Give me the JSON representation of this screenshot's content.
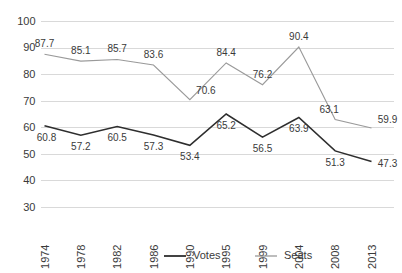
{
  "chart_data": {
    "type": "line",
    "title": "",
    "xlabel": "",
    "ylabel": "",
    "categories": [
      "1974",
      "1978",
      "1982",
      "1986",
      "1990",
      "1995",
      "1999",
      "2004",
      "2008",
      "2013"
    ],
    "series": [
      {
        "name": "Votes",
        "color": "#2e2e2e",
        "values": [
          60.8,
          57.2,
          60.5,
          57.3,
          53.4,
          65.2,
          56.5,
          63.9,
          51.3,
          47.3
        ],
        "label_position": "below"
      },
      {
        "name": "Seats",
        "color": "#9a9a9a",
        "values": [
          87.7,
          85.1,
          85.7,
          83.6,
          70.6,
          84.4,
          76.2,
          90.4,
          63.1,
          59.9
        ],
        "label_position": "above"
      }
    ],
    "ylim": [
      30,
      100
    ],
    "ytick_values": [
      30,
      40,
      50,
      60,
      70,
      80,
      90,
      100
    ],
    "ytick_labels": [
      "30",
      "40",
      "50",
      "60",
      "70",
      "80",
      "90",
      "100"
    ],
    "grid": true,
    "grid_axis": "y",
    "legend_position": "bottom",
    "legend_entries": [
      "Votes",
      "Seats"
    ],
    "xtick_rotation": -90,
    "data_labels": true
  }
}
